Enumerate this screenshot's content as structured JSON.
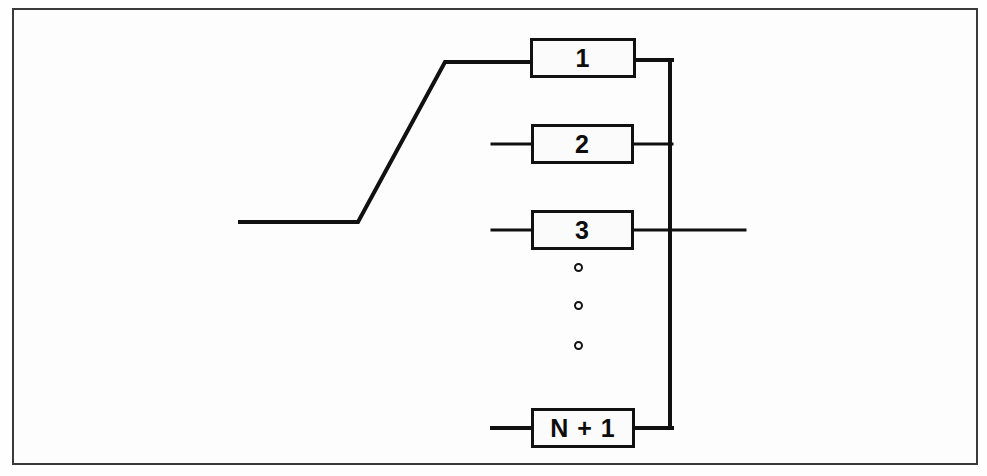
{
  "diagram": {
    "background_color": "#fefefe",
    "line_color": "#111111",
    "frame_color": "#3a3a3a",
    "blocks": [
      {
        "id": "block-1",
        "label": "1",
        "x": 530,
        "y": 38,
        "w": 106,
        "h": 40
      },
      {
        "id": "block-2",
        "label": "2",
        "x": 531,
        "y": 124,
        "w": 103,
        "h": 40
      },
      {
        "id": "block-3",
        "label": "3",
        "x": 531,
        "y": 210,
        "w": 103,
        "h": 40
      },
      {
        "id": "block-n1",
        "label": "N + 1",
        "x": 531,
        "y": 408,
        "w": 104,
        "h": 40
      }
    ],
    "ellipsis_dots": [
      {
        "x": 574,
        "y": 263
      },
      {
        "x": 574,
        "y": 301
      },
      {
        "x": 574,
        "y": 341
      }
    ],
    "bus": {
      "x": 670,
      "y_top": 60,
      "y_bottom": 428
    },
    "input_line": {
      "start_x": 240,
      "start_y": 222,
      "bend_x": 358,
      "rise_x": 445,
      "rise_y": 62,
      "end_x": 530
    },
    "output_line": {
      "x_start": 636,
      "x_end": 745,
      "y": 230
    },
    "stubs": [
      {
        "id": "stub-block-2",
        "x1": 492,
        "x2": 531,
        "y": 144
      },
      {
        "id": "stub-block-3",
        "x1": 492,
        "x2": 531,
        "y": 230
      },
      {
        "id": "stub-block-n1",
        "x1": 492,
        "x2": 531,
        "y": 428
      }
    ],
    "connectors": [
      {
        "id": "connector-block-1-to-bus",
        "x1": 636,
        "x2": 670,
        "y": 60
      },
      {
        "id": "connector-block-2-to-bus",
        "x1": 634,
        "x2": 670,
        "y": 144
      },
      {
        "id": "connector-block-n1-to-bus",
        "x1": 635,
        "x2": 670,
        "y": 428
      }
    ]
  }
}
